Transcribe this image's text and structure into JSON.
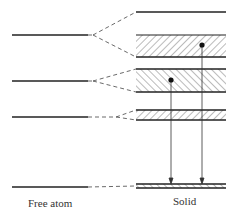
{
  "diagram": {
    "title": "",
    "labels": {
      "free_atom": "Free atom",
      "solid": "Solid"
    },
    "free_atom_levels": [
      {
        "y": 35
      },
      {
        "y": 81
      },
      {
        "y": 117
      },
      {
        "y": 187
      }
    ],
    "solid_bands": [
      {
        "type": "line",
        "y_top": 12,
        "y_bottom": 12
      },
      {
        "type": "hatched",
        "hatch": "forward",
        "y_top": 35,
        "y_bottom": 57
      },
      {
        "type": "hatched",
        "hatch": "backward",
        "y_top": 69,
        "y_bottom": 92
      },
      {
        "type": "hatched",
        "hatch": "forward",
        "y_top": 110,
        "y_bottom": 120
      },
      {
        "type": "hatched",
        "hatch": "backward",
        "y_top": 184,
        "y_bottom": 188
      }
    ],
    "electrons": [
      {
        "x": 202,
        "y": 45
      },
      {
        "x": 171,
        "y": 80
      }
    ],
    "transitions": [
      {
        "from": "electron-1",
        "x": 202,
        "to_y": 184
      },
      {
        "from": "electron-2",
        "x": 171,
        "to_y": 184
      }
    ],
    "colors": {
      "line": "#222222",
      "hatch": "#555555"
    }
  }
}
